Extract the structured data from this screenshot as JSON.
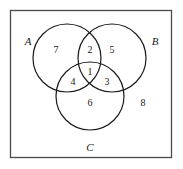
{
  "diagram": {
    "type": "venn-3-set",
    "title": "",
    "universe": {
      "shape": "rectangle",
      "x": 10,
      "y": 10,
      "width": 162,
      "height": 148,
      "stroke_color": "#4a4a4a"
    },
    "stroke_color": "#1a1a1a",
    "background_color": "#ffffff",
    "sets": [
      {
        "id": "A",
        "label": "A",
        "label_x": 28,
        "label_y": 42,
        "cx": 67,
        "cy": 58,
        "r": 34
      },
      {
        "id": "B",
        "label": "B",
        "label_x": 155,
        "label_y": 42,
        "cx": 112,
        "cy": 58,
        "r": 34
      },
      {
        "id": "C",
        "label": "C",
        "label_x": 90,
        "label_y": 148,
        "cx": 90,
        "cy": 96,
        "r": 34
      }
    ],
    "regions": [
      {
        "id": "A-only",
        "label": "7",
        "x": 56,
        "y": 51,
        "sets": [
          "A"
        ]
      },
      {
        "id": "A-and-B",
        "label": "2",
        "x": 90,
        "y": 51,
        "sets": [
          "A",
          "B"
        ]
      },
      {
        "id": "B-only",
        "label": "5",
        "x": 112,
        "y": 51,
        "sets": [
          "B"
        ]
      },
      {
        "id": "A-and-B-and-C",
        "label": "1",
        "x": 90,
        "y": 73,
        "sets": [
          "A",
          "B",
          "C"
        ]
      },
      {
        "id": "A-and-C",
        "label": "4",
        "x": 73,
        "y": 83,
        "sets": [
          "A",
          "C"
        ]
      },
      {
        "id": "B-and-C",
        "label": "3",
        "x": 107,
        "y": 83,
        "sets": [
          "B",
          "C"
        ]
      },
      {
        "id": "C-only",
        "label": "6",
        "x": 90,
        "y": 104,
        "sets": [
          "C"
        ]
      },
      {
        "id": "outside-all",
        "label": "8",
        "x": 143,
        "y": 104,
        "sets": []
      }
    ]
  }
}
